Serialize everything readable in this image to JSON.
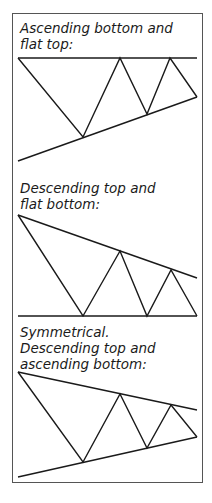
{
  "panels": [
    {
      "title": "Ascending bottom and\nflat top:",
      "pattern": "ascending-triangle"
    },
    {
      "title": "Descending top and\nflat bottom:",
      "pattern": "descending-triangle"
    },
    {
      "title": "Symmetrical.\nDescending top and\nascending bottom:",
      "pattern": "symmetrical-triangle"
    }
  ],
  "colors": {
    "line": "#1a1a1a",
    "border": "#555555",
    "background": "#ffffff"
  }
}
